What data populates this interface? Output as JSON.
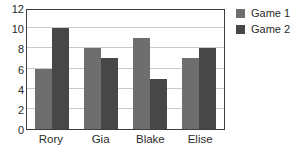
{
  "chart_data": {
    "type": "bar",
    "title": "",
    "xlabel": "",
    "ylabel": "",
    "categories": [
      "Rory",
      "Gia",
      "Blake",
      "Elise"
    ],
    "series": [
      {
        "name": "Game 1",
        "color": "#6e6e6e",
        "values": [
          6,
          8,
          9,
          7
        ]
      },
      {
        "name": "Game 2",
        "color": "#474747",
        "values": [
          10,
          7,
          5,
          8
        ]
      }
    ],
    "ylim": [
      0,
      12
    ],
    "yticks": [
      0,
      2,
      4,
      6,
      8,
      10,
      12
    ],
    "ytick_labels": [
      "0",
      "2",
      "4",
      "6",
      "8",
      "10",
      "12"
    ],
    "grid": true,
    "grid_axis": "y",
    "grid_color": "#c9c9c9",
    "legend_position": "right",
    "plot_border_color": "#3d3d3d",
    "background_color": "#ffffff"
  }
}
